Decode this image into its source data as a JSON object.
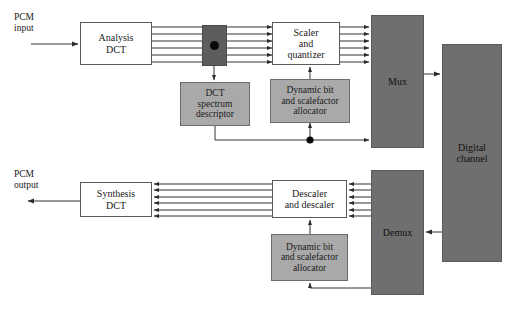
{
  "figure": {
    "colors": {
      "dark_block_fill": "#6f6f6f",
      "gray_block_fill": "#a9a9a9",
      "tap_block_fill": "#5d5d5d",
      "line": "#333333",
      "white_block_fill": "#ffffff",
      "text": "#1a1a1a"
    }
  },
  "labels": {
    "pcm_input": "PCM\ninput",
    "pcm_input_line1": "PCM",
    "pcm_input_line2": "input",
    "pcm_output_line1": "PCM",
    "pcm_output_line2": "output"
  },
  "blocks": {
    "analysis_dct": {
      "line1": "Analysis",
      "line2": "DCT"
    },
    "dct_tap": {
      "label": ""
    },
    "dct_spectrum_descriptor": {
      "line1": "DCT",
      "line2": "spectrum",
      "line3": "descriptor"
    },
    "scaler_quantizer": {
      "line1": "Scaler",
      "line2": "and",
      "line3": "quantizer"
    },
    "dynamic_allocator_encoder": {
      "line1": "Dynamic bit",
      "line2": "and scalefactor",
      "line3": "allocator"
    },
    "mux": {
      "label": "Mux"
    },
    "digital_channel": {
      "line1": "Digital",
      "line2": "channel"
    },
    "demux": {
      "label": "Demux"
    },
    "descaler": {
      "line1": "Descaler",
      "line2": "and descaler"
    },
    "dynamic_allocator_decoder": {
      "line1": "Dynamic bit",
      "line2": "and scalefactor",
      "line3": "allocator"
    },
    "synthesis_dct": {
      "line1": "Synthesis",
      "line2": "DCT"
    }
  },
  "connections": {
    "bus_line_count_encoder": 6,
    "bus_line_count_decoder": 6,
    "input_arrow": "pcm-input-to-analysis-dct",
    "output_arrow": "synthesis-dct-to-pcm-output",
    "mux_to_channel": "mux-to-digital-channel",
    "channel_to_demux": "digital-channel-to-demux",
    "descriptor_to_mux": "descriptor-to-mux-sidechain",
    "descriptor_to_allocator": "descriptor-to-dynamic-allocator",
    "demux_to_allocator": "demux-to-dynamic-allocator"
  }
}
